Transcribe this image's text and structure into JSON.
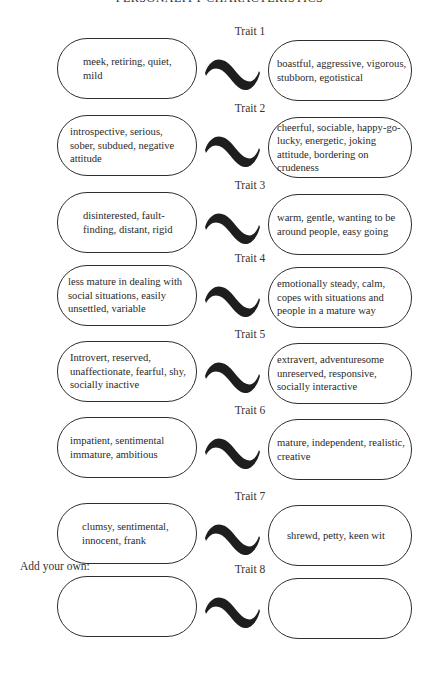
{
  "page": {
    "title": "PERSONALITY CHARACTERISTICS",
    "add_your_own_label": "Add your own:"
  },
  "traits": [
    {
      "label": "Trait 1",
      "left": "meek, retiring, quiet, mild",
      "right": "boastful, aggressive, vigorous, stubborn, egotistical"
    },
    {
      "label": "Trait 2",
      "left": "introspective, serious, sober, subdued, negative attitude",
      "right": "cheerful, sociable, happy-go-lucky, energetic, joking attitude, bordering on crudeness"
    },
    {
      "label": "Trait 3",
      "left": "disinterested, fault-finding, distant, rigid",
      "right": "warm, gentle, wanting to be around people, easy going"
    },
    {
      "label": "Trait 4",
      "left": "less mature in dealing with social situations, easily unsettled, variable",
      "right": "emotionally steady, calm, copes with situations and people in a mature way"
    },
    {
      "label": "Trait 5",
      "left": "Introvert, reserved, unaffectionate, fearful, shy, socially inactive",
      "right": "extravert, adventuresome unreserved, responsive, socially interactive"
    },
    {
      "label": "Trait 6",
      "left": "impatient, sentimental immature, ambitious",
      "right": "mature, independent, realistic, creative"
    },
    {
      "label": "Trait 7",
      "left": "clumsy, sentimental, innocent, frank",
      "right": "shrewd, petty, keen wit"
    },
    {
      "label": "Trait 8",
      "left": "",
      "right": ""
    }
  ],
  "icons": {
    "connector": "tilde-icon"
  }
}
